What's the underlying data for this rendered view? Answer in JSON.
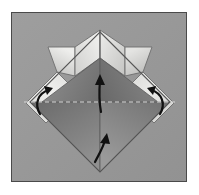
{
  "figure": {
    "kind": "origami-fold-diagram",
    "panel": {
      "background_color": "#9a9a9a",
      "border_color": "#4a4a4a",
      "page_color": "#ffffff",
      "x": 11,
      "y": 12,
      "width": 176,
      "height": 170
    },
    "colors": {
      "paper_light": "#e8e8e6",
      "paper_mid": "#c8c8c6",
      "paper_shadow_dark": "#5d5d5d",
      "paper_shadow_mid": "#757575",
      "paper_shadow_light": "#8c8c8c",
      "fold_line": "#6a6a6a",
      "crease_dashed": "#d8d8d8",
      "arrow_color": "#111111",
      "outline": "#555555"
    },
    "model": {
      "shape": "diamond-with-four-wings",
      "center": {
        "x": 100,
        "y": 94
      },
      "diamond_half_width": 64,
      "diamond_half_height": 64,
      "top_peak": {
        "x": 100,
        "y": 30
      },
      "bottom_vertex": {
        "x": 100,
        "y": 172
      },
      "left_vertex": {
        "x": 30,
        "y": 102
      },
      "right_vertex": {
        "x": 170,
        "y": 102
      }
    },
    "annotations": {
      "crease_line": {
        "name": "horizontal-dashed-crease",
        "style": "dashed",
        "y": 102,
        "x_start": 24,
        "x_end": 176
      },
      "arrows": [
        {
          "id": "arrow-left-rotate",
          "name": "left-curved-fold-arrow",
          "kind": "curved",
          "direction": "up-right",
          "x": 48,
          "y": 100
        },
        {
          "id": "arrow-right-rotate",
          "name": "right-curved-fold-arrow",
          "kind": "curved",
          "direction": "up-left",
          "x": 152,
          "y": 100
        },
        {
          "id": "arrow-center-upper",
          "name": "center-upper-fold-arrow",
          "kind": "straight-up",
          "x": 100,
          "y": 92
        },
        {
          "id": "arrow-center-lower",
          "name": "center-lower-fold-arrow",
          "kind": "curved-up",
          "x": 100,
          "y": 148
        }
      ]
    },
    "facets": [
      {
        "id": "wing-left-outer",
        "name": "left-outer-wing-facet",
        "fill": "#dcdcda"
      },
      {
        "id": "wing-left-inner",
        "name": "left-inner-wing-facet",
        "fill": "#ececea"
      },
      {
        "id": "wing-right-inner",
        "name": "right-inner-wing-facet",
        "fill": "#e4e4e2"
      },
      {
        "id": "wing-right-outer",
        "name": "right-outer-wing-facet",
        "fill": "#d2d2d0"
      },
      {
        "id": "flap-left-band",
        "name": "left-side-flap-band",
        "fill": "#e6e6e4"
      },
      {
        "id": "flap-right-band",
        "name": "right-side-flap-band",
        "fill": "#dedede"
      },
      {
        "id": "diamond-upper",
        "name": "upper-diamond-face",
        "fill": "#6e6e6e"
      },
      {
        "id": "diamond-lower",
        "name": "lower-diamond-face",
        "fill": "#828282"
      }
    ]
  }
}
